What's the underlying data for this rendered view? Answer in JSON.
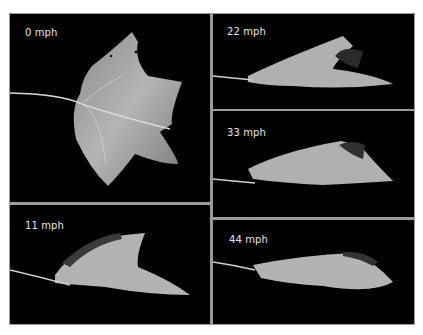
{
  "figure": {
    "panels": [
      {
        "label": "0 mph"
      },
      {
        "label": "11 mph"
      },
      {
        "label": "22 mph"
      },
      {
        "label": "33 mph"
      },
      {
        "label": "44 mph"
      }
    ]
  }
}
